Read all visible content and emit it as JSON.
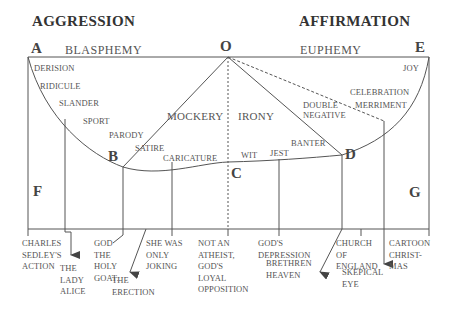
{
  "headings": {
    "left": "AGGRESSION",
    "right": "AFFIRMATION"
  },
  "points": {
    "A": "A",
    "O": "O",
    "E": "E",
    "B": "B",
    "C": "C",
    "D": "D",
    "F": "F",
    "G": "G"
  },
  "top_labels": {
    "left": "BLASPHEMY",
    "right": "EUPHEMY"
  },
  "curve_labels": {
    "derision": "DERISION",
    "ridicule": "RIDICULE",
    "slander": "SLANDER",
    "sport": "SPORT",
    "parody": "PARODY",
    "satire": "SATIRE",
    "caricature": "CARICATURE",
    "wit": "WIT",
    "jest": "JEST",
    "banter": "BANTER",
    "double_negative": "DOUBLE\nNEGATIVE",
    "merriment": "MERRIMENT",
    "celebration": "CELEBRATION",
    "joy": "JOY"
  },
  "region_labels": {
    "mockery": "MOCKERY",
    "irony": "IRONY"
  },
  "bottom_labels": {
    "charles_sedley": "CHARLES\nSEDLEY'S\nACTION",
    "lady_alice": "THE\nLADY\nALICE",
    "god_holy_goat": "GOD\nTHE\nHOLY\nGOAT.",
    "erection": "THE\nERECTION",
    "she_was_joking": "SHE WAS\nONLY\nJOKING",
    "not_an_atheist": "NOT AN\nATHEIST,\nGOD'S\nLOYAL\nOPPOSITION",
    "gods_depression": "GOD'S\nDEPRESSION",
    "brethren_heaven": "BRETHREN\nHEAVEN",
    "church_of_england": "CHURCH\nOF\nENGLAND",
    "skeptical_eye": "SKEPICAL\nEYE",
    "cartoon_christmas": "CARTOON\nCHRIST-\nMAS"
  },
  "colors": {
    "line": "#555555",
    "text": "#555555",
    "heading": "#333333"
  }
}
